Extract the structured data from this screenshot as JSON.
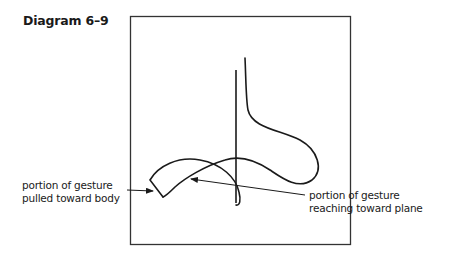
{
  "diagram": {
    "title": "Diagram 6–9",
    "labels": {
      "pulled": {
        "line1": "portion of gesture",
        "line2": "pulled toward body"
      },
      "reaching": {
        "line1": "portion of gesture",
        "line2": "reaching toward plane"
      }
    },
    "elements": [
      "frame-box",
      "vertical-stem-line",
      "gesture-curve-upper-loop",
      "gesture-curve-crescent",
      "arrow-to-pulled-portion",
      "arrow-to-reaching-portion"
    ],
    "colors": {
      "stroke": "#1a1a1a",
      "frame": "#333333",
      "background": "#ffffff"
    }
  }
}
